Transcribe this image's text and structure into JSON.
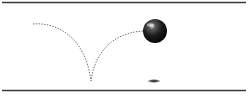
{
  "diagram": {
    "type": "bouncing-ball-illustration",
    "colors": {
      "background": "#ffffff",
      "rule_line": "#3a3a3a",
      "trajectory": "#6a6a6a",
      "ball_dark": "#0a0a0a",
      "ball_mid": "#3c3c3c",
      "ball_highlight": "#d8d8d8",
      "shadow": "#1a1a1a"
    },
    "top_line": {
      "x1": 2,
      "x2": 246,
      "y": 2.5
    },
    "bottom_line": {
      "x1": 2,
      "x2": 246,
      "y": 90.5
    },
    "trajectory_path": "M 33 24 C 55 22, 85 35, 91 81 C 96 45, 120 32, 144 31",
    "ball": {
      "cx": 155,
      "cy": 31,
      "r": 12
    },
    "shadow": {
      "cx": 154,
      "cy": 81,
      "rx": 7,
      "ry": 2
    }
  }
}
